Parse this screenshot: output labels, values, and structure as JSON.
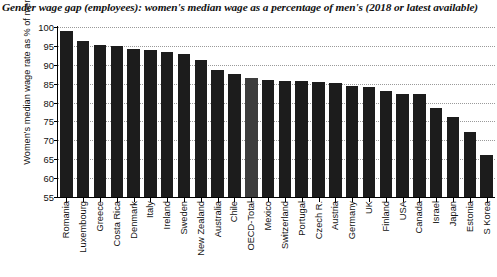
{
  "chart_data": {
    "type": "bar",
    "title": "Gender wage gap (employees): women's median wage as a percentage of men's (2018 or latest available)",
    "xlabel": "",
    "ylabel": "Women's median wage rate as % of men's",
    "ylim": [
      55,
      100
    ],
    "ytick_step": 5,
    "yticks": [
      55,
      60,
      65,
      70,
      75,
      80,
      85,
      90,
      95,
      100
    ],
    "ytick_labels": [
      "55",
      "60",
      "65",
      "70",
      "75",
      "80",
      "85",
      "90",
      "95",
      "100"
    ],
    "grid": true,
    "legend": "none",
    "bar_color": "#1c1c1c",
    "highlight_color": "#3d3d3d",
    "highlight_category": "OECD-Total",
    "categories": [
      "Romania",
      "Luxembourg",
      "Greece",
      "Costa Rica",
      "Denmark",
      "Italy",
      "Ireland",
      "Sweden",
      "New Zealand",
      "Australia",
      "Chile",
      "OECD-Total",
      "Mexico",
      "Switzerland",
      "Portugal",
      "Czech R.",
      "Austria",
      "Germany",
      "UK",
      "Finland",
      "USA",
      "Canada",
      "Israel",
      "Japan",
      "Estonia",
      "S Korea"
    ],
    "values": [
      99.0,
      96.2,
      95.2,
      95.0,
      94.2,
      93.8,
      93.4,
      92.8,
      91.2,
      88.6,
      87.5,
      86.5,
      86.0,
      85.8,
      85.6,
      85.4,
      85.2,
      84.5,
      84.2,
      83.0,
      82.3,
      82.2,
      78.6,
      76.2,
      72.2,
      66.2
    ]
  }
}
